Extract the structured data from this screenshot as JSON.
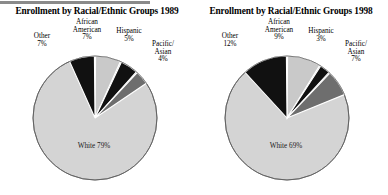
{
  "figure": {
    "background": "#ffffff",
    "rule_color": "#8a8a8a"
  },
  "chart_data": [
    {
      "type": "pie",
      "title": "Enrollment by Racial/Ethnic Groups 1989",
      "categories": [
        "African American",
        "Hispanic",
        "Pacific/ Asian",
        "White",
        "Other"
      ],
      "values": [
        7,
        5,
        4,
        79,
        7
      ],
      "labels": [
        "7%",
        "5%",
        "4%",
        "79%",
        "7%"
      ],
      "colors": [
        "#c9c9c9",
        "#111111",
        "#6e6e6e",
        "#d4d4d4",
        "#111111"
      ],
      "start_angle": 0,
      "direction": "clockwise",
      "legend": "none",
      "grid": false,
      "cat0": "African American",
      "cat1": "Hispanic",
      "cat2": "Pacific/",
      "cat2b": "Asian",
      "cat3": "White",
      "cat4": "Other",
      "pct0": "7%",
      "pct1": "5%",
      "pct2": "4%",
      "pct3": "79%",
      "pct4": "7%"
    },
    {
      "type": "pie",
      "title": "Enrollment by Racial/Ethnic Groups 1998",
      "categories": [
        "African American",
        "Hispanic",
        "Pacific/ Asian",
        "White",
        "Other"
      ],
      "values": [
        9,
        3,
        7,
        69,
        12
      ],
      "labels": [
        "9%",
        "3%",
        "7%",
        "69%",
        "12%"
      ],
      "colors": [
        "#c9c9c9",
        "#111111",
        "#6e6e6e",
        "#d4d4d4",
        "#111111"
      ],
      "start_angle": 0,
      "direction": "clockwise",
      "legend": "none",
      "grid": false,
      "cat0": "African American",
      "cat1": "Hispanic",
      "cat2": "Pacific/",
      "cat2b": "Asian",
      "cat3": "White",
      "cat4": "Other",
      "pct0": "9%",
      "pct1": "3%",
      "pct2": "7%",
      "pct3": "69%",
      "pct4": "12%"
    }
  ],
  "charts": {
    "left": {
      "title": "Enrollment by Racial/Ethnic Groups 1989",
      "african_american_name_line1": "African",
      "african_american_name_line2": "American",
      "african_american_pct": "7%",
      "hispanic_name": "Hispanic",
      "hispanic_pct": "5%",
      "pacific_name_line1": "Pacific/",
      "pacific_name_line2": "Asian",
      "pacific_pct": "4%",
      "other_name": "Other",
      "other_pct": "7%",
      "white_name": "White",
      "white_pct": "79%"
    },
    "right": {
      "title": "Enrollment by Racial/Ethnic Groups 1998",
      "african_american_name_line1": "African",
      "african_american_name_line2": "American",
      "african_american_pct": "9%",
      "hispanic_name": "Hispanic",
      "hispanic_pct": "3%",
      "pacific_name_line1": "Pacific/",
      "pacific_name_line2": "Asian",
      "pacific_pct": "7%",
      "other_name": "Other",
      "other_pct": "12%",
      "white_name": "White",
      "white_pct": "69%"
    }
  }
}
